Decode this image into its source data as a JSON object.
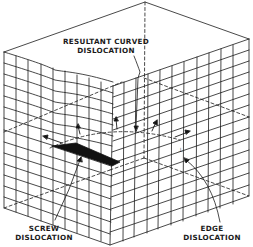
{
  "diagram": {
    "line_color": "#1a1a1a",
    "background": "#ffffff",
    "labels": {
      "resultant": {
        "line1": "RESULTANT CURVED",
        "line2": "DISLOCATION"
      },
      "screw": {
        "line1": "SCREW",
        "line2": "DISLOCATION"
      },
      "edge": {
        "line1": "EDGE",
        "line2": "DISLOCATION"
      }
    },
    "symbols": {
      "edge_marker": "⊥"
    }
  }
}
